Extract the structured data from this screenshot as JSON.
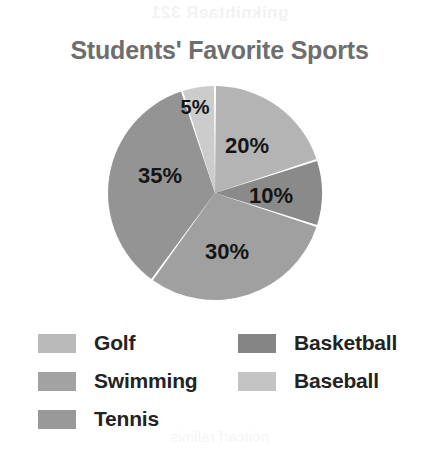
{
  "chart_data": {
    "type": "pie",
    "title": "Students' Favorite Sports",
    "xlabel": "",
    "ylabel": "",
    "unit": "percent",
    "total": 100,
    "legend_position": "bottom",
    "grid": false,
    "start_angle_deg": 0,
    "direction": "clockwise",
    "categories": [
      "Golf",
      "Basketball",
      "Swimming",
      "Tennis",
      "Baseball"
    ],
    "values": [
      20,
      10,
      30,
      35,
      5
    ],
    "labels": [
      "20%",
      "10%",
      "30%",
      "35%",
      "5%"
    ],
    "colors": [
      "#b4b4b4",
      "#8a8a8a",
      "#a0a0a0",
      "#949494",
      "#cccccc"
    ],
    "slices": [
      {
        "name": "Golf",
        "value": 20,
        "label": "20%",
        "color": "#b4b4b4",
        "start_deg": 0,
        "end_deg": 72,
        "label_x": 140,
        "label_y": 62
      },
      {
        "name": "Basketball",
        "value": 10,
        "label": "10%",
        "color": "#8a8a8a",
        "start_deg": 72,
        "end_deg": 108,
        "label_x": 164,
        "label_y": 112
      },
      {
        "name": "Swimming",
        "value": 30,
        "label": "30%",
        "color": "#a0a0a0",
        "start_deg": 108,
        "end_deg": 216,
        "label_x": 120,
        "label_y": 168
      },
      {
        "name": "Tennis",
        "value": 35,
        "label": "35%",
        "color": "#949494",
        "start_deg": 216,
        "end_deg": 342,
        "label_x": 53,
        "label_y": 92
      },
      {
        "name": "Baseball",
        "value": 5,
        "label": "5%",
        "color": "#cccccc",
        "start_deg": 342,
        "end_deg": 360,
        "label_x": 88,
        "label_y": 24
      }
    ]
  },
  "legend": {
    "columns": [
      {
        "items": [
          {
            "label": "Golf",
            "color": "#b9b9b9"
          },
          {
            "label": "Swimming",
            "color": "#a2a2a2"
          },
          {
            "label": "Tennis",
            "color": "#999999"
          }
        ]
      },
      {
        "items": [
          {
            "label": "Basketball",
            "color": "#858585"
          },
          {
            "label": "Baseball",
            "color": "#c4c4c4"
          }
        ]
      }
    ]
  },
  "artifacts": {
    "bleed_top": "gniknihtaeR 321",
    "bleed_bottom": "noitcarf ralimis"
  }
}
